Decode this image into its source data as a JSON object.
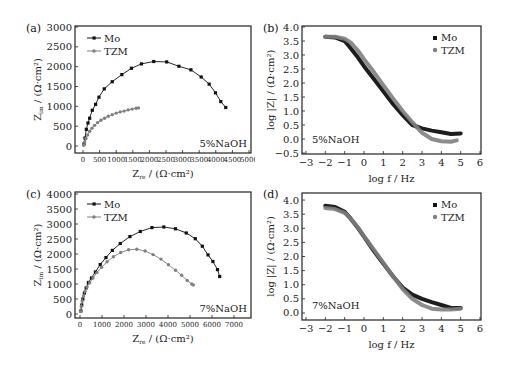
{
  "colors": {
    "mo": "#111111",
    "tzm": "#808080",
    "axis": "#222222"
  },
  "chart_data": [
    {
      "id": "a",
      "panel_label": "(a)",
      "type": "line",
      "subtype": "nyquist",
      "xlabel": "Z_re / (Ω·cm²)",
      "ylabel": "Z_im / (Ω·cm²)",
      "xlim": [
        0,
        5000
      ],
      "ylim": [
        0,
        3000
      ],
      "xticks": [
        0,
        500,
        1000,
        1500,
        2000,
        2500,
        3000,
        3500,
        4000,
        4500,
        5000
      ],
      "yticks": [
        0,
        500,
        1000,
        1500,
        2000,
        2500,
        3000
      ],
      "annotation": "5%NaOH",
      "legend": {
        "position": "upper-left",
        "entries": [
          "Mo",
          "TZM"
        ]
      },
      "series": [
        {
          "name": "Mo",
          "x": [
            30,
            60,
            100,
            150,
            200,
            280,
            380,
            480,
            640,
            880,
            1170,
            1460,
            1760,
            2130,
            2520,
            2890,
            3250,
            3560,
            3800,
            3990,
            4150,
            4300
          ],
          "y": [
            50,
            200,
            420,
            580,
            700,
            900,
            1050,
            1230,
            1440,
            1620,
            1800,
            1960,
            2070,
            2130,
            2120,
            2010,
            1920,
            1740,
            1560,
            1340,
            1120,
            970
          ]
        },
        {
          "name": "TZM",
          "x": [
            20,
            50,
            90,
            140,
            200,
            270,
            350,
            440,
            540,
            650,
            760,
            880,
            1000,
            1120,
            1240,
            1360,
            1480,
            1600,
            1670
          ],
          "y": [
            20,
            100,
            190,
            280,
            370,
            450,
            520,
            590,
            650,
            700,
            750,
            790,
            830,
            860,
            880,
            910,
            930,
            950,
            960
          ]
        }
      ]
    },
    {
      "id": "b",
      "panel_label": "(b)",
      "type": "scatter",
      "subtype": "bode",
      "xlabel": "log f / Hz",
      "ylabel": "log |Z| / (Ω·cm²)",
      "xlim": [
        -3,
        6
      ],
      "ylim": [
        -0.5,
        4.0
      ],
      "xticks": [
        -3,
        -2,
        -1,
        0,
        1,
        2,
        3,
        4,
        5,
        6
      ],
      "yticks": [
        -0.5,
        0.0,
        0.5,
        1.0,
        1.5,
        2.0,
        2.5,
        3.0,
        3.5,
        4.0
      ],
      "annotation": "5%NaOH",
      "legend": {
        "position": "upper-right",
        "entries": [
          "Mo",
          "TZM"
        ]
      },
      "series": [
        {
          "name": "Mo",
          "x": [
            -2,
            -1.5,
            -1,
            -0.7,
            -0.3,
            0,
            0.5,
            1,
            1.5,
            2,
            2.5,
            3,
            3.5,
            4,
            4.5,
            5
          ],
          "y": [
            3.65,
            3.63,
            3.5,
            3.25,
            2.9,
            2.6,
            2.15,
            1.7,
            1.25,
            0.85,
            0.5,
            0.38,
            0.3,
            0.24,
            0.18,
            0.2
          ]
        },
        {
          "name": "TZM",
          "x": [
            -2,
            -1.5,
            -1,
            -0.7,
            -0.3,
            0,
            0.5,
            1,
            1.5,
            2,
            2.5,
            3,
            3.5,
            4,
            4.5,
            4.8
          ],
          "y": [
            3.65,
            3.65,
            3.58,
            3.45,
            3.15,
            2.85,
            2.4,
            1.92,
            1.45,
            1.0,
            0.6,
            0.22,
            0.0,
            -0.08,
            -0.1,
            -0.05
          ]
        }
      ]
    },
    {
      "id": "c",
      "panel_label": "(c)",
      "type": "line",
      "subtype": "nyquist",
      "xlabel": "Z_re / (Ω·cm²)",
      "ylabel": "Z_im / (Ω·cm²)",
      "xlim": [
        0,
        7500
      ],
      "ylim": [
        0,
        4000
      ],
      "xticks": [
        0,
        1000,
        2000,
        3000,
        4000,
        5000,
        6000,
        7000
      ],
      "yticks": [
        0,
        500,
        1000,
        1500,
        2000,
        2500,
        3000,
        3500,
        4000
      ],
      "annotation": "7%NaOH",
      "legend": {
        "position": "upper-left",
        "entries": [
          "Mo",
          "TZM"
        ]
      },
      "series": [
        {
          "name": "Mo",
          "x": [
            40,
            80,
            130,
            200,
            280,
            380,
            520,
            700,
            920,
            1180,
            1470,
            1830,
            2270,
            2740,
            3270,
            3810,
            4340,
            4830,
            5240,
            5560,
            5820,
            6040,
            6250,
            6350
          ],
          "y": [
            100,
            300,
            500,
            700,
            870,
            1050,
            1200,
            1400,
            1650,
            1880,
            2120,
            2350,
            2580,
            2750,
            2880,
            2900,
            2840,
            2700,
            2510,
            2260,
            1970,
            1750,
            1480,
            1250,
            1010
          ]
        },
        {
          "name": "TZM",
          "x": [
            30,
            60,
            100,
            160,
            230,
            320,
            440,
            590,
            770,
            980,
            1230,
            1520,
            1850,
            2210,
            2580,
            2960,
            3320,
            3680,
            4020,
            4340,
            4620,
            4870,
            5080,
            5150
          ],
          "y": [
            80,
            250,
            430,
            600,
            760,
            900,
            1040,
            1200,
            1380,
            1560,
            1740,
            1910,
            2050,
            2140,
            2160,
            2100,
            1980,
            1830,
            1640,
            1460,
            1290,
            1120,
            1000,
            970
          ]
        }
      ]
    },
    {
      "id": "d",
      "panel_label": "(d)",
      "type": "scatter",
      "subtype": "bode",
      "xlabel": "log f / Hz",
      "ylabel": "log |Z| / (Ω·cm²)",
      "xlim": [
        -3,
        6
      ],
      "ylim": [
        -0.25,
        4.25
      ],
      "xticks": [
        -3,
        -2,
        -1,
        0,
        1,
        2,
        3,
        4,
        5,
        6
      ],
      "yticks": [
        0.0,
        0.5,
        1.0,
        1.5,
        2.0,
        2.5,
        3.0,
        3.5,
        4.0
      ],
      "annotation": "7%NaOH",
      "legend": {
        "position": "upper-right",
        "entries": [
          "Mo",
          "TZM"
        ]
      },
      "series": [
        {
          "name": "Mo",
          "x": [
            -2,
            -1.5,
            -1,
            -0.7,
            -0.3,
            0,
            0.5,
            1,
            1.5,
            2,
            2.5,
            3,
            3.5,
            4,
            4.5,
            5
          ],
          "y": [
            3.8,
            3.75,
            3.58,
            3.35,
            3.0,
            2.7,
            2.2,
            1.75,
            1.3,
            0.9,
            0.65,
            0.5,
            0.38,
            0.28,
            0.18,
            0.18
          ]
        },
        {
          "name": "TZM",
          "x": [
            -2,
            -1.5,
            -1,
            -0.7,
            -0.3,
            0,
            0.5,
            1,
            1.5,
            2,
            2.5,
            3,
            3.5,
            4,
            4.5,
            5
          ],
          "y": [
            3.72,
            3.68,
            3.55,
            3.35,
            3.02,
            2.72,
            2.25,
            1.78,
            1.3,
            0.85,
            0.5,
            0.28,
            0.15,
            0.12,
            0.12,
            0.15
          ]
        }
      ]
    }
  ],
  "panels": {
    "a": {
      "label": "(a)",
      "annotation": "5%NaOH",
      "legend_mo": "Mo",
      "legend_tzm": "TZM",
      "xlabel": "Z",
      "xlabel_sub": "re",
      "xlabel_unit": " / (Ω·cm²)",
      "ylabel": "Z",
      "ylabel_sub": "im",
      "ylabel_unit": " / (Ω·cm²)"
    },
    "b": {
      "label": "(b)",
      "annotation": "5%NaOH",
      "legend_mo": "Mo",
      "legend_tzm": "TZM",
      "xlabel": "log f / Hz",
      "ylabel": "log |Z| / (Ω·cm²)"
    },
    "c": {
      "label": "(c)",
      "annotation": "7%NaOH",
      "legend_mo": "Mo",
      "legend_tzm": "TZM",
      "xlabel": "Z",
      "xlabel_sub": "re",
      "xlabel_unit": " / (Ω·cm²)",
      "ylabel": "Z",
      "ylabel_sub": "im",
      "ylabel_unit": " / (Ω·cm²)"
    },
    "d": {
      "label": "(d)",
      "annotation": "7%NaOH",
      "legend_mo": "Mo",
      "legend_tzm": "TZM",
      "xlabel": "log f / Hz",
      "ylabel": "log |Z| / (Ω·cm²)"
    }
  }
}
